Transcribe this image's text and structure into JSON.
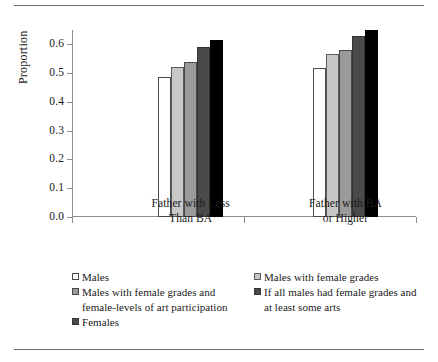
{
  "chart_data": {
    "type": "bar",
    "title": "",
    "xlabel": "",
    "ylabel": "Proportion",
    "ylim": [
      0.0,
      0.65
    ],
    "yticks": [
      "0.0",
      "0.1",
      "0.2",
      "0.3",
      "0.4",
      "0.5",
      "0.6"
    ],
    "ytick_values": [
      0.0,
      0.1,
      0.2,
      0.3,
      0.4,
      0.5,
      0.6
    ],
    "grid": false,
    "legend_position": "bottom",
    "categories": [
      "Father with Less Than BA",
      "Father with BA or Higher"
    ],
    "category_lines": [
      [
        "Father with Less",
        "Than BA"
      ],
      [
        "Father with BA",
        "or Higher"
      ]
    ],
    "series": [
      {
        "name": "Males",
        "shade": "s0",
        "color": "#ffffff",
        "values": [
          0.487,
          0.518
        ]
      },
      {
        "name": "Males with female grades",
        "shade": "s1",
        "color": "#c8c8c8",
        "values": [
          0.523,
          0.565
        ]
      },
      {
        "name": "Males with female grades and female-levels of art participation",
        "shade": "s2",
        "color": "#9a9a9a",
        "values": [
          0.54,
          0.582
        ]
      },
      {
        "name": "If all males had female grades and at least some arts",
        "shade": "s3",
        "color": "#4a4a4a",
        "values": [
          0.592,
          0.628
        ]
      },
      {
        "name": "Females",
        "shade": "s4",
        "color": "#000000",
        "values": [
          0.615,
          0.65
        ]
      }
    ]
  },
  "legend": {
    "left_column": [
      {
        "swatch": "s0",
        "label": "Males"
      },
      {
        "swatch": "s1",
        "label": "Males with female grades and female-levels of art participation"
      },
      {
        "swatch": "s3",
        "label": "Females"
      }
    ],
    "right_column": [
      {
        "swatch": "s2",
        "label": "Males with female grades"
      },
      {
        "swatch": "s3",
        "label": "If all males had female grades and at least some arts"
      }
    ]
  }
}
